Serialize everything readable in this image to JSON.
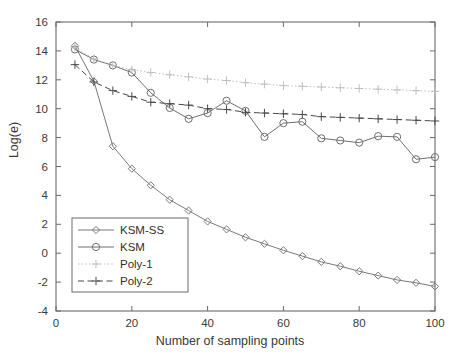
{
  "chart_data": {
    "type": "line",
    "title": "",
    "xlabel": "Number of sampling points",
    "ylabel": "Log(e)",
    "xlim": [
      0,
      100
    ],
    "ylim": [
      -4,
      16
    ],
    "xticks": [
      0,
      20,
      40,
      60,
      80,
      100
    ],
    "yticks": [
      -4,
      -2,
      0,
      2,
      4,
      6,
      8,
      10,
      12,
      14,
      16
    ],
    "grid": false,
    "legend_position": "lower-left",
    "x": [
      5,
      10,
      15,
      20,
      25,
      30,
      35,
      40,
      45,
      50,
      55,
      60,
      65,
      70,
      75,
      80,
      85,
      90,
      95,
      100
    ],
    "series": [
      {
        "name": "KSM-SS",
        "marker": "diamond",
        "linestyle": "solid",
        "color": "#7a7a7a",
        "values": [
          14.35,
          11.9,
          7.4,
          5.85,
          4.7,
          3.7,
          2.95,
          2.2,
          1.65,
          1.1,
          0.65,
          0.2,
          -0.2,
          -0.6,
          -0.9,
          -1.25,
          -1.55,
          -1.85,
          -2.05,
          -2.3
        ]
      },
      {
        "name": "KSM",
        "marker": "circle",
        "linestyle": "solid",
        "color": "#6f6f6f",
        "values": [
          14.1,
          13.4,
          13.0,
          12.5,
          11.1,
          10.05,
          9.3,
          9.7,
          10.55,
          9.85,
          8.05,
          9.0,
          9.1,
          7.95,
          7.8,
          7.65,
          8.1,
          8.05,
          6.5,
          6.65
        ]
      },
      {
        "name": "Poly-1",
        "marker": "plus",
        "linestyle": "dotted",
        "color": "#bfbfbf",
        "values": [
          14.25,
          13.45,
          13.0,
          12.7,
          12.5,
          12.35,
          12.2,
          12.05,
          11.95,
          11.8,
          11.7,
          11.6,
          11.55,
          11.5,
          11.45,
          11.4,
          11.35,
          11.3,
          11.25,
          11.2
        ]
      },
      {
        "name": "Poly-2",
        "marker": "plus",
        "linestyle": "dashed",
        "color": "#4a4a4a",
        "values": [
          13.05,
          11.85,
          11.25,
          10.85,
          10.45,
          10.35,
          10.25,
          10.0,
          9.95,
          9.75,
          9.7,
          9.65,
          9.6,
          9.45,
          9.4,
          9.35,
          9.3,
          9.25,
          9.2,
          9.15
        ]
      }
    ]
  },
  "legend": {
    "items": [
      {
        "label": "KSM-SS"
      },
      {
        "label": "KSM"
      },
      {
        "label": "Poly-1"
      },
      {
        "label": "Poly-2"
      }
    ]
  }
}
